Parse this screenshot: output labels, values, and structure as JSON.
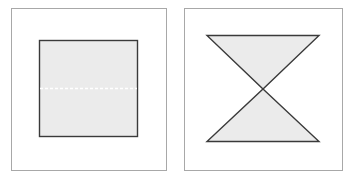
{
  "figure": {
    "panels": [
      {
        "name": "square-panel",
        "shape": "square",
        "fill": "#ebebeb",
        "stroke": "#3a3a3a",
        "divider": "dashed-horizontal-midline",
        "divider_color": "#ffffff"
      },
      {
        "name": "hourglass-panel",
        "shape": "hourglass (two triangles meeting at apex)",
        "fill": "#ebebeb",
        "stroke": "#3a3a3a"
      }
    ],
    "colors": {
      "frame": "#a8a8a8",
      "shape_fill": "#ebebeb",
      "shape_stroke": "#3a3a3a",
      "background": "#ffffff"
    }
  }
}
